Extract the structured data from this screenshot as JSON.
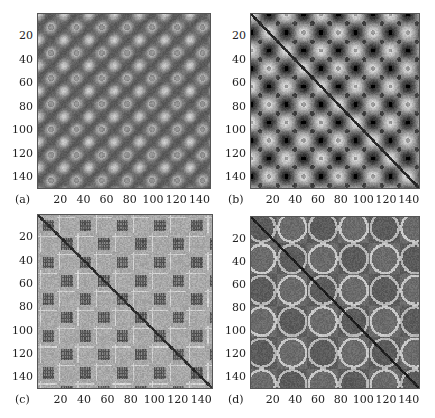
{
  "chart_data": [
    {
      "type": "heatmap",
      "panel_label": "(a)",
      "title": "",
      "xlabel": "",
      "ylabel": "",
      "x_ticks": [
        20,
        40,
        60,
        80,
        100,
        120,
        140
      ],
      "y_ticks": [
        20,
        40,
        60,
        80,
        100,
        120,
        140
      ],
      "xlim": [
        1,
        150
      ],
      "ylim": [
        1,
        150
      ],
      "colormap": "grayscale",
      "pattern": "periodic blob lattice: dark diagonal bands separating light blobs with dark centers, period ~22",
      "period": 22,
      "box": {
        "left": 37,
        "top": 13,
        "width": 174,
        "height": 176
      }
    },
    {
      "type": "heatmap",
      "panel_label": "(b)",
      "title": "",
      "xlabel": "",
      "ylabel": "",
      "x_ticks": [
        20,
        40,
        60,
        80,
        100,
        120,
        140
      ],
      "y_ticks": [
        20,
        40,
        60,
        80,
        100,
        120,
        140
      ],
      "xlim": [
        1,
        150
      ],
      "ylim": [
        1,
        150
      ],
      "colormap": "grayscale",
      "pattern": "diamond lattice with dark main diagonal and dark anti-diagonal crossings, period ~31",
      "period": 31,
      "box": {
        "left": 250,
        "top": 13,
        "width": 170,
        "height": 176
      }
    },
    {
      "type": "heatmap",
      "panel_label": "(c)",
      "title": "",
      "xlabel": "",
      "ylabel": "",
      "x_ticks": [
        20,
        40,
        60,
        80,
        100,
        120,
        140
      ],
      "y_ticks": [
        20,
        40,
        60,
        80,
        100,
        120,
        140
      ],
      "xlim": [
        1,
        150
      ],
      "ylim": [
        1,
        150
      ],
      "colormap": "grayscale",
      "pattern": "light gray background with checkered dark hatched squares and a thin dark main diagonal, period ~16",
      "period": 16,
      "box": {
        "left": 37,
        "top": 214,
        "width": 176,
        "height": 175
      }
    },
    {
      "type": "heatmap",
      "panel_label": "(d)",
      "title": "",
      "xlabel": "",
      "ylabel": "",
      "x_ticks": [
        20,
        40,
        60,
        80,
        100,
        120,
        140
      ],
      "y_ticks": [
        20,
        40,
        60,
        80,
        100,
        120,
        140
      ],
      "xlim": [
        1,
        150
      ],
      "ylim": [
        1,
        150
      ],
      "colormap": "grayscale",
      "pattern": "large dark block structure with light rounded outlines, strong dark main diagonal, block period ~55",
      "period": 55,
      "box": {
        "left": 250,
        "top": 216,
        "width": 170,
        "height": 173
      }
    }
  ]
}
